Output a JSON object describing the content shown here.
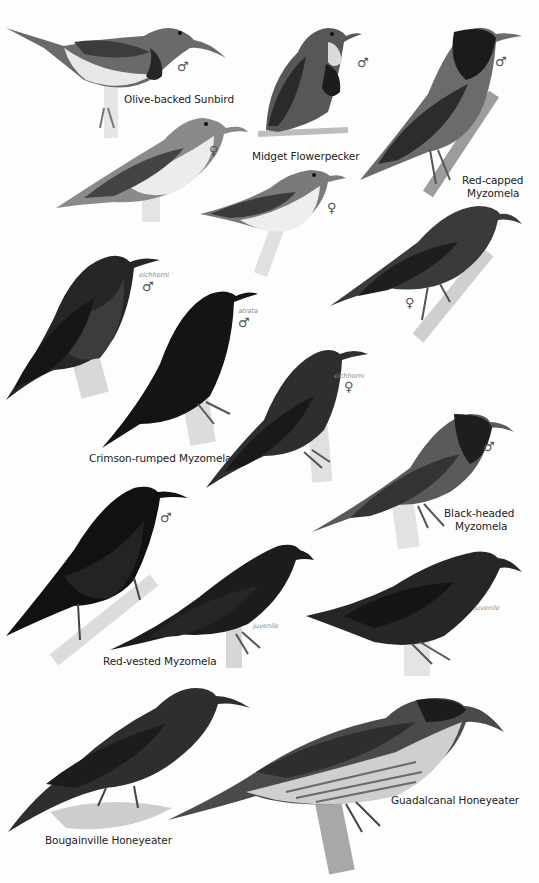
{
  "plate": {
    "background": "#fdfdfd",
    "species": [
      {
        "id": "olive-backed-sunbird",
        "name": "Olive-backed Sunbird",
        "figures": [
          {
            "sex": "♂",
            "subspecies": "",
            "tone": "#5e5e5e"
          },
          {
            "sex": "♀",
            "subspecies": "",
            "tone": "#7a7a7a"
          }
        ]
      },
      {
        "id": "midget-flowerpecker",
        "name": "Midget Flowerpecker",
        "figures": [
          {
            "sex": "♂",
            "subspecies": "",
            "tone": "#3a3a3a"
          },
          {
            "sex": "♀",
            "subspecies": "",
            "tone": "#6a6a6a"
          }
        ]
      },
      {
        "id": "red-capped-myzomela",
        "name_line1": "Red-capped",
        "name_line2": "Myzomela",
        "figures": [
          {
            "sex": "♂",
            "subspecies": "",
            "tone": "#222222"
          },
          {
            "sex": "♀",
            "subspecies": "",
            "tone": "#2e2e2e"
          }
        ]
      },
      {
        "id": "crimson-rumped-myzomela",
        "name": "Crimson-rumped Myzomela",
        "figures": [
          {
            "sex": "♂",
            "subspecies": "eichhorni",
            "tone": "#1e1e1e"
          },
          {
            "sex": "♂",
            "subspecies": "atrata",
            "tone": "#111111"
          },
          {
            "sex": "♀",
            "subspecies": "eichhorni",
            "tone": "#2a2a2a"
          }
        ]
      },
      {
        "id": "black-headed-myzomela",
        "name_line1": "Black-headed",
        "name_line2": "Myzomela",
        "figures": [
          {
            "sex": "♂",
            "subspecies": "",
            "tone": "#3d3d3d"
          },
          {
            "sex": "",
            "subspecies": "juvenile",
            "tone": "#262626"
          }
        ]
      },
      {
        "id": "red-vested-myzomela",
        "name": "Red-vested Myzomela",
        "figures": [
          {
            "sex": "♂",
            "subspecies": "",
            "tone": "#141414"
          },
          {
            "sex": "",
            "subspecies": "juvenile",
            "tone": "#1c1c1c"
          }
        ]
      },
      {
        "id": "bougainville-honeyeater",
        "name": "Bougainville Honeyeater",
        "figures": [
          {
            "sex": "",
            "subspecies": "",
            "tone": "#2a2a2a"
          }
        ]
      },
      {
        "id": "guadalcanal-honeyeater",
        "name": "Guadalcanal Honeyeater",
        "figures": [
          {
            "sex": "",
            "subspecies": "",
            "tone": "#3a3a3a"
          }
        ]
      }
    ]
  },
  "labels": {
    "olive_backed_sunbird": "Olive-backed Sunbird",
    "midget_flowerpecker": "Midget Flowerpecker",
    "red_capped_1": "Red-capped",
    "red_capped_2": "Myzomela",
    "crimson_rumped": "Crimson-rumped Myzomela",
    "black_headed_1": "Black-headed",
    "black_headed_2": "Myzomela",
    "red_vested": "Red-vested Myzomela",
    "bougainville": "Bougainville Honeyeater",
    "guadalcanal": "Guadalcanal Honeyeater"
  },
  "marks": {
    "male": "♂",
    "female": "♀",
    "eichhorni": "eichhorni",
    "atrata": "atrata",
    "juvenile": "juvenile"
  }
}
